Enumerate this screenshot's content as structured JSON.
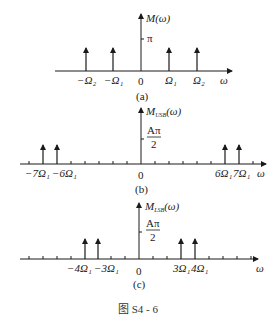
{
  "figure_caption": "图 S4 - 6",
  "panels": [
    {
      "id": "a",
      "caption": "(a)",
      "y_label": "M(ω)",
      "y_tick_label": "π",
      "x_label": "ω",
      "origin_label": "0",
      "impulses": [
        {
          "label": "−Ω₂",
          "position": "-Omega2"
        },
        {
          "label": "−Ω₁",
          "position": "-Omega1"
        },
        {
          "label": "Ω₁",
          "position": "Omega1"
        },
        {
          "label": "Ω₂",
          "position": "Omega2"
        }
      ]
    },
    {
      "id": "b",
      "caption": "(b)",
      "y_label": "M_USB(ω)",
      "y_label_main": "M",
      "y_label_sub": "USB",
      "y_label_tail": "(ω)",
      "y_tick_label_num": "Aπ",
      "y_tick_label_den": "2",
      "x_label": "ω",
      "origin_label": "0",
      "impulses": [
        {
          "label": "−7Ω₁",
          "multiple": -7
        },
        {
          "label": "−6Ω₁",
          "multiple": -6
        },
        {
          "label": "6Ω₁",
          "multiple": 6
        },
        {
          "label": "7Ω₁",
          "multiple": 7
        }
      ]
    },
    {
      "id": "c",
      "caption": "(c)",
      "y_label": "M_LSB(ω)",
      "y_label_main": "M",
      "y_label_sub": "LSB",
      "y_label_tail": "(ω)",
      "y_tick_label_num": "Aπ",
      "y_tick_label_den": "2",
      "x_label": "ω",
      "origin_label": "0",
      "impulses": [
        {
          "label": "−4Ω₁",
          "multiple": -4
        },
        {
          "label": "−3Ω₁",
          "multiple": -3
        },
        {
          "label": "3Ω₁",
          "multiple": 3
        },
        {
          "label": "4Ω₁",
          "multiple": 4
        }
      ]
    }
  ]
}
